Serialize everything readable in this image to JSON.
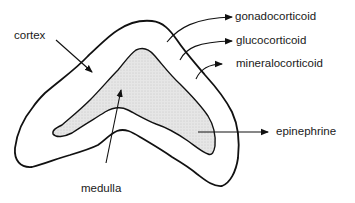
{
  "diagram": {
    "regions": {
      "cortex": {
        "label": "cortex"
      },
      "medulla": {
        "label": "medulla"
      }
    },
    "hormones": [
      {
        "label": "gonadocorticoid",
        "source": "cortex outer zone"
      },
      {
        "label": "glucocorticoid",
        "source": "cortex middle zone"
      },
      {
        "label": "mineralocorticoid",
        "source": "cortex inner zone"
      },
      {
        "label": "epinephrine",
        "source": "medulla"
      }
    ],
    "colors": {
      "outline": "#111111",
      "medulla_fill": "#d9d9d9",
      "background": "#ffffff"
    }
  }
}
